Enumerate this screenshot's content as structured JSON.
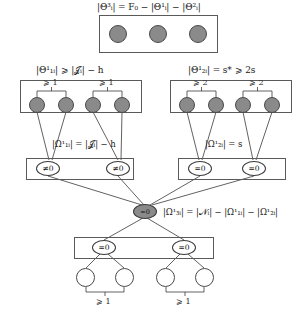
{
  "figure": {
    "type": "tree-diagram",
    "title_top": "|Θ³ᵢ| = F₀ − |Θ¹ᵢ| − |Θ²ᵢ|",
    "level2_left_label": "|Θ¹₁ᵢ| ⩾ |𝒥ᵢ| − h",
    "level2_right_label": "|Θ¹₂ᵢ| = s* ⩾ 2s",
    "omega_left_label": "|Ω¹₁ᵢ| = |𝒥ᵢ| − h",
    "omega_right_label": "|Ω¹₂ᵢ| = s",
    "center_label": "|Ω¹₃ᵢ| = |𝒩ᵢ| − |Ω¹₁ᵢ| − |Ω¹₂ᵢ|",
    "center_node_text": "=0",
    "brackets": {
      "l2_left_a": "⩾ 1",
      "l2_left_b": "⩾ 1",
      "l2_right_a": "⩾ 2",
      "l2_right_b": "⩾ 2",
      "bottom_a": "⩾ 1",
      "bottom_b": "⩾ 1"
    },
    "node_texts": {
      "omega_left_1": "≠0",
      "omega_left_2": "≠0",
      "omega_right_1": "=0",
      "omega_right_2": "=0",
      "bottom_1": "=0",
      "bottom_2": "=0"
    }
  }
}
